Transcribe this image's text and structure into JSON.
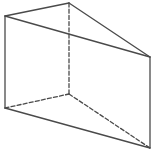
{
  "diagram": {
    "type": "triangular-prism",
    "canvas": {
      "width": 152,
      "height": 150,
      "background": "#ffffff"
    },
    "style": {
      "stroke": "#4a4a4a",
      "stroke_width": 1.3,
      "dash": "4 2.2"
    },
    "vertices": {
      "A": {
        "x": 5,
        "y": 16,
        "role": "front-top-left"
      },
      "B": {
        "x": 69,
        "y": 3,
        "role": "back-top"
      },
      "C": {
        "x": 150,
        "y": 57,
        "role": "front-top-right"
      },
      "D": {
        "x": 5,
        "y": 108,
        "role": "front-bottom-left"
      },
      "E": {
        "x": 69,
        "y": 94,
        "role": "back-bottom (hidden)"
      },
      "F": {
        "x": 150,
        "y": 148,
        "role": "front-bottom-right"
      }
    },
    "edges": [
      {
        "id": "AB",
        "from": "A",
        "to": "B",
        "style": "solid"
      },
      {
        "id": "BC",
        "from": "B",
        "to": "C",
        "style": "solid"
      },
      {
        "id": "AC",
        "from": "A",
        "to": "C",
        "style": "solid"
      },
      {
        "id": "AD",
        "from": "A",
        "to": "D",
        "style": "solid"
      },
      {
        "id": "CF",
        "from": "C",
        "to": "F",
        "style": "solid"
      },
      {
        "id": "DF",
        "from": "D",
        "to": "F",
        "style": "solid"
      },
      {
        "id": "BE",
        "from": "B",
        "to": "E",
        "style": "dashed"
      },
      {
        "id": "DE",
        "from": "D",
        "to": "E",
        "style": "dashed"
      },
      {
        "id": "EF",
        "from": "E",
        "to": "F",
        "style": "dashed"
      }
    ]
  }
}
